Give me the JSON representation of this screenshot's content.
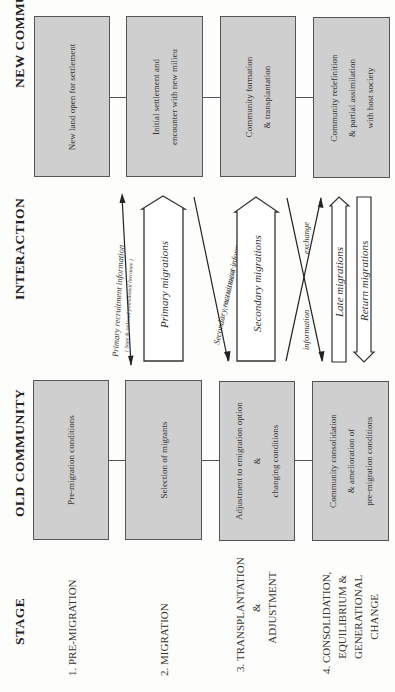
{
  "headers": {
    "stage": "STAGE",
    "old_community": "OLD COMMUNITY",
    "interaction": "INTERACTION",
    "new_community": "NEW COMMUNITY"
  },
  "stages": [
    {
      "number": "1.",
      "lines": [
        "PRE-MIGRATION"
      ]
    },
    {
      "number": "2.",
      "lines": [
        "MIGRATION"
      ]
    },
    {
      "number": "3.",
      "lines": [
        "TRANSPLANTATION",
        "&",
        "ADJUSTMENT"
      ]
    },
    {
      "number": "4.",
      "lines": [
        "CONSOLIDATION,",
        "EQUILIBRIUM &",
        "GENERATIONAL",
        "CHANGE"
      ]
    }
  ],
  "old_community_boxes": [
    {
      "lines": [
        "Pre-migration conditions"
      ]
    },
    {
      "lines": [
        "Selection of migrants"
      ]
    },
    {
      "lines": [
        "Adjustment to emigration option",
        "&",
        "changing conditions"
      ]
    },
    {
      "lines": [
        "Community consolidation",
        "& amelioration of",
        "pre-migration conditions"
      ]
    }
  ],
  "new_community_boxes": [
    {
      "lines": [
        "New land open for settlement"
      ]
    },
    {
      "lines": [
        "Initial settlement and",
        "encounter with new milieu"
      ]
    },
    {
      "lines": [
        "Community formation",
        "& transplantation"
      ]
    },
    {
      "lines": [
        "Community redefinition",
        "& partial assimilation",
        "with host society"
      ]
    }
  ],
  "interaction": {
    "primary_info": {
      "label": "Primary recruitment information",
      "sublabel": "( State & railroad promotional literature )"
    },
    "primary_migrations": "Primary migrations",
    "secondary_info": {
      "label": "Secondary recruitment information",
      "sublabel": "( \"America Letters\" )"
    },
    "secondary_migrations": "Secondary migrations",
    "exchange_left": "information",
    "exchange_right": "exchange",
    "late_migrations": "Late migrations",
    "return_migrations": "Return migrations"
  },
  "colors": {
    "box_fill": "#cfcfcf",
    "box_border": "#555555",
    "background": "#fdfdfb",
    "ink": "#2a2a2a"
  }
}
